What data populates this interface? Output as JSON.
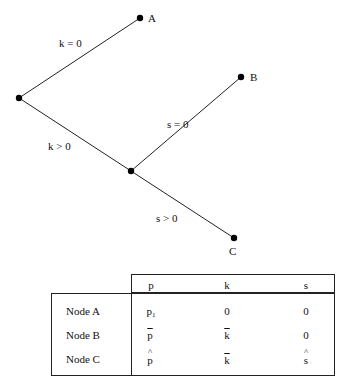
{
  "tree": {
    "nodes": [
      {
        "id": "root",
        "x": 19,
        "y": 98,
        "label": ""
      },
      {
        "id": "A",
        "x": 140,
        "y": 18,
        "label": "A"
      },
      {
        "id": "mid",
        "x": 131,
        "y": 171,
        "label": ""
      },
      {
        "id": "B",
        "x": 241,
        "y": 77,
        "label": "B"
      },
      {
        "id": "C",
        "x": 234,
        "y": 238,
        "label": "C"
      }
    ],
    "edges": [
      {
        "from": "root",
        "to": "A",
        "label": "k = 0"
      },
      {
        "from": "root",
        "to": "mid",
        "label": "k > 0"
      },
      {
        "from": "mid",
        "to": "B",
        "label": "s = 0"
      },
      {
        "from": "mid",
        "to": "C",
        "label": "s > 0"
      }
    ],
    "node_labels": {
      "A": "A",
      "B": "B",
      "C": "C"
    },
    "edge_labels": {
      "k_eq_0": "k = 0",
      "k_gt_0": "k > 0",
      "s_eq_0": "s = 0",
      "s_gt_0": "s > 0"
    }
  },
  "table": {
    "headers": [
      "p",
      "k",
      "s"
    ],
    "rows": [
      {
        "label": "Node A",
        "p": "p",
        "p_sub": "1",
        "p_mark": "subscript",
        "k": "0",
        "k_mark": "none",
        "s": "0",
        "s_mark": "none"
      },
      {
        "label": "Node B",
        "p": "p",
        "p_mark": "bar",
        "k": "k",
        "k_mark": "bar",
        "s": "0",
        "s_mark": "none"
      },
      {
        "label": "Node C",
        "p": "p",
        "p_mark": "hat",
        "k": "k",
        "k_mark": "bar",
        "s": "s",
        "s_mark": "hat"
      }
    ]
  },
  "colors": {
    "line": "#222222",
    "text": "#111111",
    "background": "#ffffff"
  }
}
